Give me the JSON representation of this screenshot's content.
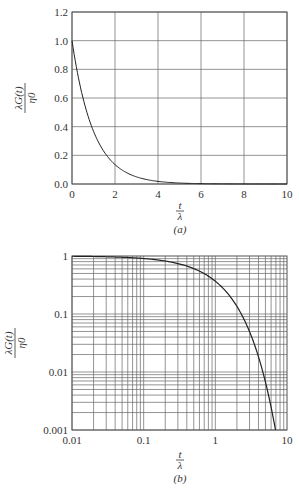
{
  "chart_data": [
    {
      "type": "line",
      "id": "a",
      "caption": "(a)",
      "xlabel_num": "t",
      "xlabel_den": "λ",
      "ylabel_num": "λG(t)",
      "ylabel_den": "η0",
      "xscale": "linear",
      "yscale": "linear",
      "xlim": [
        0,
        10
      ],
      "ylim": [
        0,
        1.2
      ],
      "xticks": [
        0,
        2,
        4,
        6,
        8,
        10
      ],
      "xtick_labels": [
        "0",
        "2",
        "4",
        "6",
        "8",
        "10"
      ],
      "yticks": [
        0,
        0.2,
        0.4,
        0.6,
        0.8,
        1.0,
        1.2
      ],
      "ytick_labels": [
        "0.0",
        "0.2",
        "0.4",
        "0.6",
        "0.8",
        "1.0",
        "1.2"
      ],
      "grid": true,
      "series": [
        {
          "name": "exp(-t/λ)",
          "x": [
            0,
            0.5,
            1,
            1.5,
            2,
            2.5,
            3,
            4,
            5,
            6,
            7,
            8,
            9,
            10
          ],
          "y": [
            1.0,
            0.607,
            0.368,
            0.223,
            0.135,
            0.082,
            0.05,
            0.018,
            0.007,
            0.002,
            0.001,
            0.0003,
            0.0001,
            5e-05
          ]
        }
      ]
    },
    {
      "type": "line",
      "id": "b",
      "caption": "(b)",
      "xlabel_num": "t",
      "xlabel_den": "λ",
      "ylabel_num": "λG(t)",
      "ylabel_den": "η0",
      "xscale": "log",
      "yscale": "log",
      "xlim": [
        0.01,
        10
      ],
      "ylim": [
        0.001,
        1
      ],
      "xticks": [
        0.01,
        0.1,
        1,
        10
      ],
      "xtick_labels": [
        "0.01",
        "0.1",
        "1",
        "10"
      ],
      "yticks": [
        0.001,
        0.01,
        0.1,
        1
      ],
      "ytick_labels": [
        "0.001",
        "0.01",
        "0.1",
        "1"
      ],
      "grid": true,
      "series": [
        {
          "name": "exp(-t/λ)",
          "x": [
            0.01,
            0.03,
            0.1,
            0.3,
            0.5,
            1,
            1.5,
            2,
            3,
            4,
            5,
            6,
            6.9
          ],
          "y": [
            0.99,
            0.97,
            0.905,
            0.741,
            0.607,
            0.368,
            0.223,
            0.135,
            0.05,
            0.018,
            0.0067,
            0.0025,
            0.001
          ]
        }
      ]
    }
  ]
}
